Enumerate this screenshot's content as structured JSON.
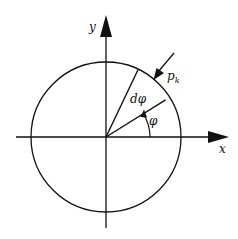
{
  "diagram": {
    "axes": {
      "x_label": "x",
      "y_label": "y"
    },
    "labels": {
      "angle": "φ",
      "d_angle": "dφ",
      "pressure": "p",
      "pressure_sub": "k"
    },
    "geometry": {
      "center": [
        106,
        137
      ],
      "radius": 75,
      "phi_deg": 32,
      "phi_plus_dphi_deg": 63,
      "pressure_arrow_angle_deg": 50
    },
    "colors": {
      "stroke": "#111111",
      "background": "#ffffff"
    }
  }
}
